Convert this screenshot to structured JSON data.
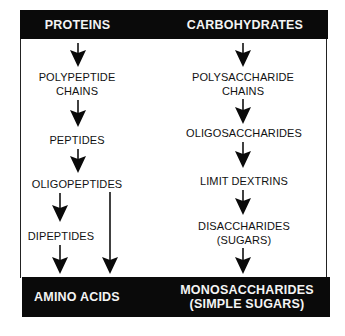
{
  "diagram": {
    "type": "digestion-flowchart",
    "columns": [
      {
        "header": "PROTEINS",
        "steps": [
          {
            "lines": [
              "POLYPEPTIDE",
              "CHAINS"
            ]
          },
          {
            "lines": [
              "PEPTIDES"
            ]
          },
          {
            "lines": [
              "OLIGOPEPTIDES"
            ]
          },
          {
            "lines": [
              "DIPEPTIDES"
            ]
          }
        ],
        "footer": [
          "AMINO ACIDS"
        ]
      },
      {
        "header": "CARBOHYDRATES",
        "steps": [
          {
            "lines": [
              "POLYSACCHARIDE",
              "CHAINS"
            ]
          },
          {
            "lines": [
              "OLIGOSACCHARIDES"
            ]
          },
          {
            "lines": [
              "LIMIT DEXTRINS"
            ]
          },
          {
            "lines": [
              "DISACCHARIDES",
              "(SUGARS)"
            ]
          }
        ],
        "footer": [
          "MONOSACCHARIDES",
          "(SIMPLE SUGARS)"
        ]
      }
    ],
    "arrows": [
      {
        "column": "proteins",
        "from": "PROTEINS",
        "to": "POLYPEPTIDE CHAINS"
      },
      {
        "column": "proteins",
        "from": "POLYPEPTIDE CHAINS",
        "to": "PEPTIDES"
      },
      {
        "column": "proteins",
        "from": "PEPTIDES",
        "to": "OLIGOPEPTIDES"
      },
      {
        "column": "proteins",
        "from": "OLIGOPEPTIDES",
        "to": "DIPEPTIDES"
      },
      {
        "column": "proteins",
        "from": "DIPEPTIDES",
        "to": "AMINO ACIDS"
      },
      {
        "column": "proteins",
        "from": "OLIGOPEPTIDES",
        "to": "AMINO ACIDS"
      },
      {
        "column": "carbohydrates",
        "from": "CARBOHYDRATES",
        "to": "POLYSACCHARIDE CHAINS"
      },
      {
        "column": "carbohydrates",
        "from": "POLYSACCHARIDE CHAINS",
        "to": "OLIGOSACCHARIDES"
      },
      {
        "column": "carbohydrates",
        "from": "OLIGOSACCHARIDES",
        "to": "LIMIT DEXTRINS"
      },
      {
        "column": "carbohydrates",
        "from": "LIMIT DEXTRINS",
        "to": "DISACCHARIDES (SUGARS)"
      },
      {
        "column": "carbohydrates",
        "from": "DISACCHARIDES (SUGARS)",
        "to": "MONOSACCHARIDES (SIMPLE SUGARS)"
      }
    ],
    "colors": {
      "bar": "#0a0a0a",
      "bar_text": "#f4f4f4",
      "text": "#111111",
      "background": "#ffffff"
    }
  }
}
